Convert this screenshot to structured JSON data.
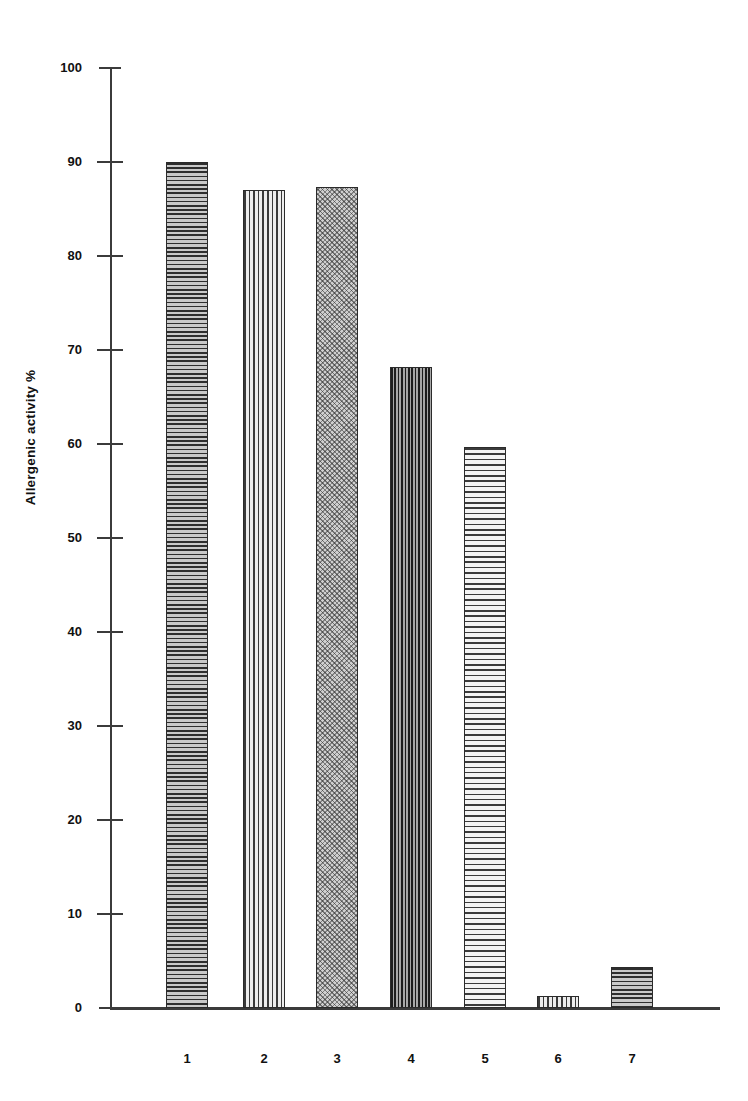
{
  "chart_data": {
    "type": "bar",
    "title": "",
    "xlabel": "",
    "ylabel": "Allergenic activity %",
    "categories": [
      "1",
      "2",
      "3",
      "4",
      "5",
      "6",
      "7"
    ],
    "values": [
      90.0,
      87.0,
      87.3,
      68.2,
      59.7,
      1.3,
      4.4
    ],
    "ylim": [
      0,
      100
    ],
    "yticks": [
      0,
      10,
      20,
      30,
      40,
      50,
      60,
      70,
      80,
      90,
      100
    ],
    "ytick_labels": [
      "0",
      "10",
      "20",
      "30",
      "40",
      "50",
      "60",
      "70",
      "80",
      "90",
      "100"
    ],
    "grid": false,
    "legend": false,
    "series": [
      {
        "name": "Allergenic activity %",
        "values": [
          90.0,
          87.0,
          87.3,
          68.2,
          59.7,
          1.3,
          4.4
        ],
        "fill_patterns": [
          "horizontal-lines-dark",
          "vertical-lines",
          "stipple-light",
          "crosshatch-dark",
          "horizontal-lines-light",
          "vertical-lines",
          "horizontal-lines-dark"
        ]
      }
    ]
  },
  "axes": {
    "y_title": "Allergenic activity %",
    "y_ticks": [
      {
        "label": "100",
        "value": 100
      },
      {
        "label": "90",
        "value": 90
      },
      {
        "label": "80",
        "value": 80
      },
      {
        "label": "70",
        "value": 70
      },
      {
        "label": "60",
        "value": 60
      },
      {
        "label": "50",
        "value": 50
      },
      {
        "label": "40",
        "value": 40
      },
      {
        "label": "30",
        "value": 30
      },
      {
        "label": "20",
        "value": 20
      },
      {
        "label": "10",
        "value": 10
      },
      {
        "label": "0",
        "value": 0
      }
    ],
    "x_categories": [
      "1",
      "2",
      "3",
      "4",
      "5",
      "6",
      "7"
    ]
  },
  "colors": {
    "axis": "#3b3b3b",
    "text": "#111111",
    "background": "#ffffff",
    "bar_outline": "#2b2b2b"
  }
}
